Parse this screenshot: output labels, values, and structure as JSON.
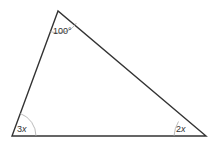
{
  "diagram": {
    "type": "triangle",
    "vertices": {
      "top": {
        "x": 58,
        "y": 11
      },
      "bottom_left": {
        "x": 12,
        "y": 136
      },
      "bottom_right": {
        "x": 206,
        "y": 136
      }
    },
    "angles": {
      "top": {
        "label": "100°"
      },
      "bottom_left": {
        "label_num": "3",
        "label_var": "x"
      },
      "bottom_right": {
        "label_num": "2",
        "label_var": "x"
      }
    },
    "colors": {
      "stroke": "#333333",
      "arc": "#999999",
      "text": "#333333"
    }
  }
}
